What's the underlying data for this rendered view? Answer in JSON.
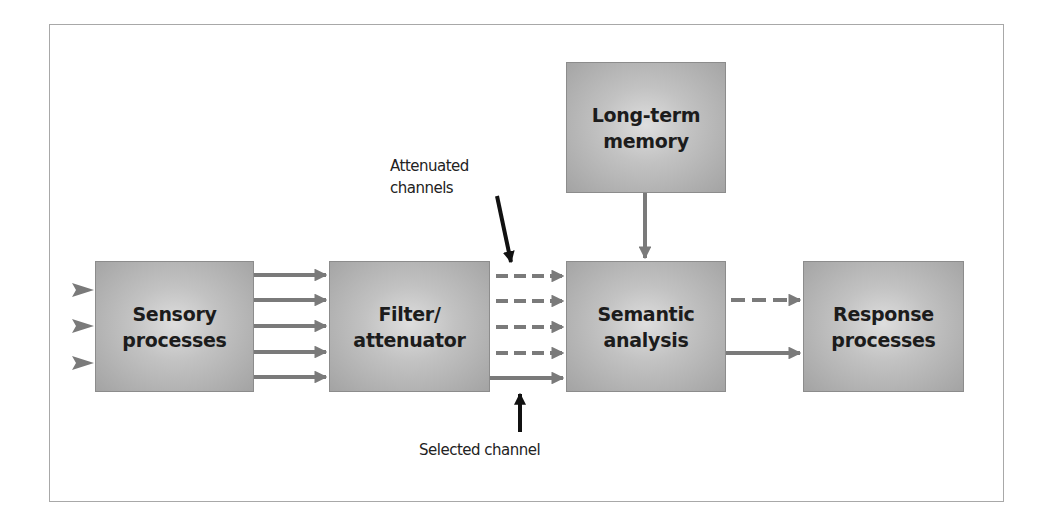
{
  "diagram": {
    "boxes": {
      "sensory": {
        "label": "Sensory\nprocesses"
      },
      "filter": {
        "label": "Filter/\nattenuator"
      },
      "semantic": {
        "label": "Semantic\nanalysis"
      },
      "memory": {
        "label": "Long-term\nmemory"
      },
      "response": {
        "label": "Response\nprocesses"
      }
    },
    "annotations": {
      "attenuated": "Attenuated\nchannels",
      "selected": "Selected channel"
    },
    "colors": {
      "arrow": "#7a7a7a",
      "pointer": "#111111",
      "box_edge": "#a3a3a3",
      "box_center": "#dedede",
      "frame": "#a8a8a8"
    },
    "connections": [
      {
        "from": "input",
        "to": "sensory",
        "count": 3,
        "style": "solid"
      },
      {
        "from": "sensory",
        "to": "filter",
        "count": 5,
        "style": "solid"
      },
      {
        "from": "filter",
        "to": "semantic",
        "count": 4,
        "style": "dashed"
      },
      {
        "from": "filter",
        "to": "semantic",
        "count": 1,
        "style": "solid"
      },
      {
        "from": "memory",
        "to": "semantic",
        "count": 1,
        "style": "solid"
      },
      {
        "from": "semantic",
        "to": "response",
        "count": 1,
        "style": "dashed"
      },
      {
        "from": "semantic",
        "to": "response",
        "count": 1,
        "style": "solid"
      }
    ]
  }
}
